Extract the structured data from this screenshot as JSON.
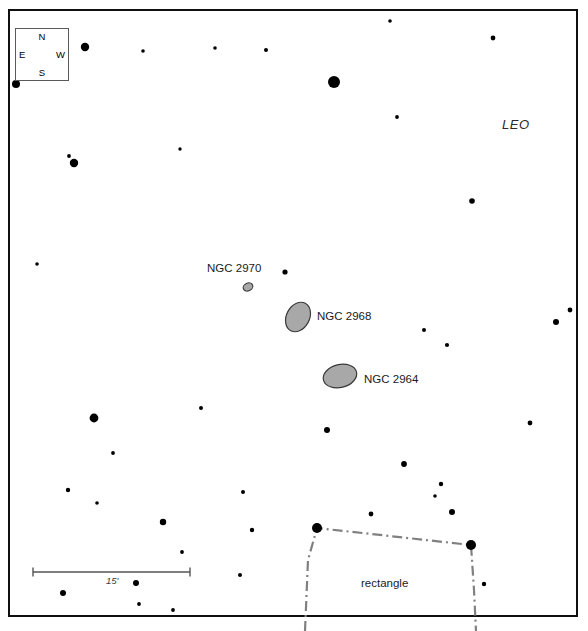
{
  "chart_data": {
    "type": "scatter",
    "title": "",
    "constellation_label": "LEO",
    "xlim": [
      0,
      588
    ],
    "ylim": [
      0,
      631
    ],
    "grid": false,
    "legend": "none",
    "frame": {
      "x": 8,
      "y": 9,
      "width": 570,
      "height": 608,
      "border_color": "#101010",
      "border_width": 2.5
    },
    "compass": {
      "north": "N",
      "south": "S",
      "east": "E",
      "west": "W",
      "box": {
        "x": 15,
        "y": 28,
        "width": 54,
        "height": 53
      }
    },
    "scale_bar": {
      "label": "15'",
      "x1": 33,
      "x2": 190,
      "y": 572,
      "tick_height": 9,
      "color": "#555555"
    },
    "galaxies": [
      {
        "name": "NGC 2970",
        "cx": 248,
        "cy": 287,
        "rx": 5.0,
        "ry": 3.8,
        "angle": -25,
        "fill": "#a8a8a8",
        "stroke": "#3a3a3a",
        "label_x": 207,
        "label_y": 263
      },
      {
        "name": "NGC 2968",
        "cx": 298,
        "cy": 317,
        "rx": 11.5,
        "ry": 15.5,
        "angle": 28,
        "fill": "#a8a8a8",
        "stroke": "#3a3a3a",
        "label_x": 317,
        "label_y": 311
      },
      {
        "name": "NGC 2964",
        "cx": 340,
        "cy": 376,
        "rx": 17.0,
        "ry": 11.5,
        "angle": -14,
        "fill": "#a8a8a8",
        "stroke": "#3a3a3a",
        "label_x": 364,
        "label_y": 374
      }
    ],
    "region_overlay": {
      "label": "rectangle",
      "label_x": 361,
      "label_y": 578,
      "line_color": "#808080",
      "line_width": 2.2,
      "dash": "10,4,2,4",
      "corners": [
        {
          "x": 317,
          "y": 528
        },
        {
          "x": 471,
          "y": 545
        }
      ],
      "path": "M 305 631 L 308 560 L 317 528 L 471 545 L 474 590 L 476 631"
    },
    "stars": [
      {
        "x": 16,
        "y": 84,
        "r": 4.0
      },
      {
        "x": 85,
        "y": 47,
        "r": 4.2
      },
      {
        "x": 143,
        "y": 51,
        "r": 1.8
      },
      {
        "x": 215,
        "y": 48,
        "r": 1.8
      },
      {
        "x": 266,
        "y": 50,
        "r": 2.0
      },
      {
        "x": 390,
        "y": 21,
        "r": 1.8
      },
      {
        "x": 493,
        "y": 38,
        "r": 2.4
      },
      {
        "x": 334,
        "y": 82,
        "r": 6.0
      },
      {
        "x": 397,
        "y": 117,
        "r": 1.9
      },
      {
        "x": 180,
        "y": 149,
        "r": 1.7
      },
      {
        "x": 74,
        "y": 163,
        "r": 4.2
      },
      {
        "x": 69,
        "y": 156,
        "r": 1.9
      },
      {
        "x": 472,
        "y": 201,
        "r": 2.8
      },
      {
        "x": 37,
        "y": 264,
        "r": 1.8
      },
      {
        "x": 285,
        "y": 272,
        "r": 2.6
      },
      {
        "x": 556,
        "y": 322,
        "r": 3.0
      },
      {
        "x": 570,
        "y": 310,
        "r": 2.4
      },
      {
        "x": 424,
        "y": 330,
        "r": 2.0
      },
      {
        "x": 447,
        "y": 345,
        "r": 2.1
      },
      {
        "x": 94,
        "y": 418,
        "r": 4.4
      },
      {
        "x": 201,
        "y": 408,
        "r": 2.0
      },
      {
        "x": 327,
        "y": 430,
        "r": 3.0
      },
      {
        "x": 530,
        "y": 423,
        "r": 2.4
      },
      {
        "x": 113,
        "y": 453,
        "r": 1.9
      },
      {
        "x": 404,
        "y": 464,
        "r": 2.9
      },
      {
        "x": 68,
        "y": 490,
        "r": 2.2
      },
      {
        "x": 97,
        "y": 503,
        "r": 1.8
      },
      {
        "x": 243,
        "y": 492,
        "r": 2.0
      },
      {
        "x": 441,
        "y": 484,
        "r": 2.2
      },
      {
        "x": 435,
        "y": 496,
        "r": 1.8
      },
      {
        "x": 163,
        "y": 522,
        "r": 3.2
      },
      {
        "x": 252,
        "y": 530,
        "r": 2.2
      },
      {
        "x": 452,
        "y": 512,
        "r": 3.0
      },
      {
        "x": 182,
        "y": 552,
        "r": 1.9
      },
      {
        "x": 136,
        "y": 583,
        "r": 3.0
      },
      {
        "x": 240,
        "y": 575,
        "r": 2.0
      },
      {
        "x": 63,
        "y": 593,
        "r": 3.0
      },
      {
        "x": 139,
        "y": 604,
        "r": 1.9
      },
      {
        "x": 173,
        "y": 610,
        "r": 1.9
      },
      {
        "x": 484,
        "y": 584,
        "r": 2.2
      },
      {
        "x": 371,
        "y": 514,
        "r": 2.4
      }
    ]
  }
}
